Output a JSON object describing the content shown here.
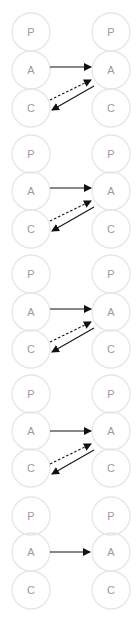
{
  "diagram": {
    "background": "#ffffff",
    "node_stroke": "#e6e6e6",
    "node_label_color": "#9a9a9a",
    "arrow_color": "#111111",
    "columns": {
      "left_x": 31,
      "right_x": 111
    },
    "node_radius": 19,
    "groups": [
      {
        "name": "group-1",
        "y": {
          "P": 32,
          "A": 70,
          "C": 108
        },
        "left_nodes": [
          "P",
          "A",
          "C"
        ],
        "right_nodes": [
          "P",
          "A",
          "C"
        ],
        "arrows": [
          {
            "kind": "solid",
            "from": "left-A",
            "to": "right-A",
            "x1": 50,
            "y1": 67,
            "x2": 91,
            "y2": 67
          },
          {
            "kind": "dashed",
            "from": "left-C",
            "to": "right-A",
            "x1": 50,
            "y1": 100,
            "x2": 91,
            "y2": 80
          },
          {
            "kind": "solid",
            "from": "right-A",
            "to": "left-C",
            "x1": 94,
            "y1": 86,
            "x2": 52,
            "y2": 110
          }
        ]
      },
      {
        "name": "group-2",
        "y": {
          "P": 154,
          "A": 191,
          "C": 229
        },
        "left_nodes": [
          "P",
          "A",
          "C"
        ],
        "right_nodes": [
          "P",
          "A",
          "C"
        ],
        "arrows": [
          {
            "kind": "solid",
            "from": "left-A",
            "to": "right-A",
            "x1": 50,
            "y1": 188,
            "x2": 91,
            "y2": 188
          },
          {
            "kind": "dashed",
            "from": "left-C",
            "to": "right-A",
            "x1": 50,
            "y1": 221,
            "x2": 91,
            "y2": 201
          },
          {
            "kind": "solid",
            "from": "right-A",
            "to": "left-C",
            "x1": 94,
            "y1": 207,
            "x2": 52,
            "y2": 231
          }
        ]
      },
      {
        "name": "group-3",
        "y": {
          "P": 274,
          "A": 312,
          "C": 349
        },
        "left_nodes": [
          "P",
          "A",
          "C"
        ],
        "right_nodes": [
          "P",
          "A",
          "C"
        ],
        "arrows": [
          {
            "kind": "solid",
            "from": "left-A",
            "to": "right-A",
            "x1": 50,
            "y1": 309,
            "x2": 91,
            "y2": 309
          },
          {
            "kind": "dashed",
            "from": "left-C",
            "to": "right-A",
            "x1": 50,
            "y1": 342,
            "x2": 91,
            "y2": 322
          },
          {
            "kind": "solid",
            "from": "right-A",
            "to": "left-C",
            "x1": 94,
            "y1": 328,
            "x2": 52,
            "y2": 352
          }
        ]
      },
      {
        "name": "group-4",
        "y": {
          "P": 394,
          "A": 431,
          "C": 468
        },
        "left_nodes": [
          "P",
          "A",
          "C"
        ],
        "right_nodes": [
          "P",
          "A",
          "C"
        ],
        "arrows": [
          {
            "kind": "solid",
            "from": "left-A",
            "to": "right-A",
            "x1": 50,
            "y1": 431,
            "x2": 91,
            "y2": 431
          },
          {
            "kind": "dashed",
            "from": "left-C",
            "to": "right-A",
            "x1": 50,
            "y1": 464,
            "x2": 91,
            "y2": 444
          },
          {
            "kind": "solid",
            "from": "right-A",
            "to": "left-C",
            "x1": 94,
            "y1": 450,
            "x2": 52,
            "y2": 474
          }
        ]
      },
      {
        "name": "group-5",
        "y": {
          "P": 516,
          "A": 552,
          "C": 590
        },
        "left_nodes": [
          "P",
          "A",
          "C"
        ],
        "right_nodes": [
          "P",
          "A",
          "C"
        ],
        "arrows": [
          {
            "kind": "solid",
            "from": "left-A",
            "to": "right-A",
            "x1": 50,
            "y1": 552,
            "x2": 90,
            "y2": 552
          }
        ]
      }
    ]
  }
}
